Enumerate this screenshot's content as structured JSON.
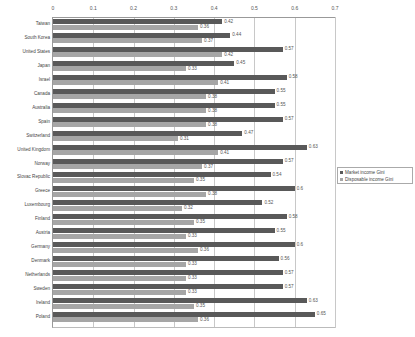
{
  "chart_data": {
    "type": "bar",
    "orientation": "horizontal",
    "title": "",
    "xlabel": "",
    "ylabel": "",
    "xlim": [
      0,
      0.7
    ],
    "xticks": [
      "0",
      "0.1",
      "0.2",
      "0.3",
      "0.4",
      "0.5",
      "0.6",
      "0.7"
    ],
    "x_axis_position": "top",
    "grid": true,
    "legend_position": "right",
    "categories": [
      "Taiwan",
      "South Korea",
      "United States",
      "Japan",
      "Israel",
      "Canada",
      "Australia",
      "Spain",
      "Switzerland",
      "United Kingdom",
      "Norway",
      "Slovac Republic",
      "Greece",
      "Luxembourg",
      "Finland",
      "Austria",
      "Germany",
      "Denmark",
      "Netherlands",
      "Sweden",
      "Ireland",
      "Poland"
    ],
    "series": [
      {
        "name": "Market income Gini",
        "color": "#595959",
        "values": [
          0.42,
          0.44,
          0.57,
          0.45,
          0.58,
          0.55,
          0.55,
          0.57,
          0.47,
          0.63,
          0.57,
          0.54,
          0.6,
          0.52,
          0.58,
          0.55,
          0.6,
          0.56,
          0.57,
          0.57,
          0.63,
          0.65
        ]
      },
      {
        "name": "Disposable income Gini",
        "color": "#a6a6a6",
        "values": [
          0.36,
          0.37,
          0.42,
          0.33,
          0.41,
          0.38,
          0.38,
          0.38,
          0.31,
          0.41,
          0.37,
          0.35,
          0.38,
          0.32,
          0.35,
          0.33,
          0.36,
          0.33,
          0.33,
          0.33,
          0.35,
          0.36
        ]
      }
    ],
    "value_labels": true
  },
  "legend": {
    "items": [
      {
        "label": "Market income Gini",
        "color": "#595959"
      },
      {
        "label": "Disposable income Gini",
        "color": "#a6a6a6"
      }
    ]
  }
}
